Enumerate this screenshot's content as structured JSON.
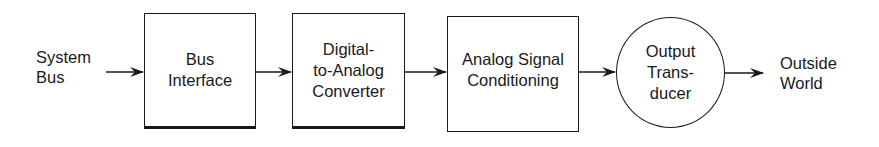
{
  "diagram": {
    "type": "block-diagram",
    "direction": "left-to-right",
    "input": {
      "lines": [
        "System",
        "Bus"
      ]
    },
    "blocks": [
      {
        "shape": "rectangle",
        "lines": [
          "Bus",
          "Interface"
        ]
      },
      {
        "shape": "rectangle",
        "lines": [
          "Digital-",
          "to-Analog",
          "Converter"
        ]
      },
      {
        "shape": "rectangle",
        "lines": [
          "Analog Signal",
          "Conditioning"
        ]
      },
      {
        "shape": "circle",
        "lines": [
          "Output",
          "Trans-",
          "ducer"
        ]
      }
    ],
    "output": {
      "lines": [
        "Outside",
        "World"
      ]
    },
    "edges": [
      {
        "from": "System Bus",
        "to": "Bus Interface"
      },
      {
        "from": "Bus Interface",
        "to": "Digital-to-Analog Converter"
      },
      {
        "from": "Digital-to-Analog Converter",
        "to": "Analog Signal Conditioning"
      },
      {
        "from": "Analog Signal Conditioning",
        "to": "Output Transducer"
      },
      {
        "from": "Output Transducer",
        "to": "Outside World"
      }
    ],
    "colors": {
      "stroke": "#1a1a1a",
      "background": "#ffffff"
    }
  }
}
